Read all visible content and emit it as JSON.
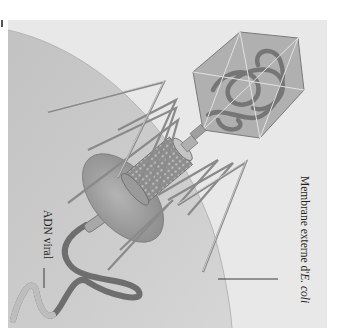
{
  "figure": {
    "orientation": "rotated 90 degrees clockwise",
    "labels": {
      "membrane": {
        "text_prefix": "Membrane externe d'",
        "text_italic": "E. coli"
      },
      "dna": {
        "text": "ADN viral"
      }
    },
    "colors": {
      "background": "#e8e8e8",
      "membrane_fill": "#c9c9c9",
      "capsid_fill": "#a9a9a9",
      "dna_dark": "#6e6e6e",
      "dna_light": "#bdbdbd",
      "fiber": "#8a8a8a",
      "baseplate": "#9c9c9c",
      "text": "#1e1e1e"
    }
  }
}
